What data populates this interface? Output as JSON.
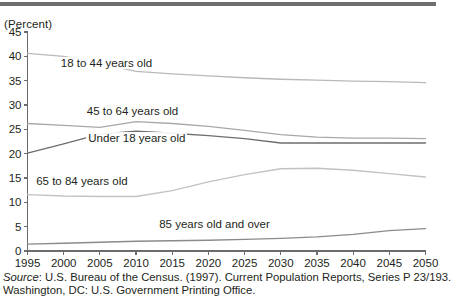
{
  "figure": {
    "axis_unit_label": "(Percent)",
    "source_italic_word": "Source",
    "source_line1_rest": ": U.S. Bureau of the Census. (1997). Current Population Reports, Series P 23/193.",
    "source_line2": "Washington, DC: U.S. Government Printing Office."
  },
  "chart_data": {
    "type": "line",
    "title": "",
    "xlabel": "",
    "ylabel": "(Percent)",
    "xlim": [
      1995,
      2050
    ],
    "ylim": [
      0,
      45
    ],
    "grid": false,
    "legend": "inline-labels",
    "x_ticks": [
      1995,
      2000,
      2005,
      2010,
      2015,
      2020,
      2025,
      2030,
      2035,
      2040,
      2045,
      2050
    ],
    "y_ticks": [
      0,
      5,
      10,
      15,
      20,
      25,
      30,
      35,
      40,
      45
    ],
    "x": [
      1995,
      2000,
      2005,
      2010,
      2015,
      2020,
      2025,
      2030,
      2035,
      2040,
      2045,
      2050
    ],
    "series": [
      {
        "name": "18 to 44 years old",
        "color": "#b9b9b9",
        "label_x": 1999.6,
        "label_y": 38.6,
        "values": [
          40.6,
          40.0,
          38.6,
          36.9,
          36.4,
          36.0,
          35.6,
          35.3,
          35.1,
          34.9,
          34.8,
          34.6
        ]
      },
      {
        "name": "45 to 64 years old",
        "color": "#a8a8a8",
        "label_x": 2003.2,
        "label_y": 28.7,
        "values": [
          26.2,
          25.8,
          25.4,
          26.6,
          26.2,
          25.6,
          24.8,
          23.9,
          23.4,
          23.2,
          23.2,
          23.1
        ]
      },
      {
        "name": "Under 18 years old",
        "color": "#6d6d6d",
        "label_x": 2003.4,
        "label_y": 23.3,
        "values": [
          20.1,
          22.0,
          24.0,
          24.6,
          24.2,
          23.7,
          23.1,
          22.2,
          22.2,
          22.2,
          22.2,
          22.2
        ]
      },
      {
        "name": "65 to 84 years old",
        "color": "#c2c2c2",
        "label_x": 1996.2,
        "label_y": 14.4,
        "values": [
          11.6,
          11.3,
          11.2,
          11.2,
          12.4,
          14.2,
          15.7,
          16.9,
          17.0,
          16.6,
          15.9,
          15.2
        ]
      },
      {
        "name": "85 years old and over",
        "color": "#8b8b8b",
        "label_x": 2013.2,
        "label_y": 5.5,
        "values": [
          1.4,
          1.6,
          1.8,
          2.0,
          2.1,
          2.2,
          2.4,
          2.6,
          2.9,
          3.4,
          4.2,
          4.6
        ]
      }
    ]
  }
}
